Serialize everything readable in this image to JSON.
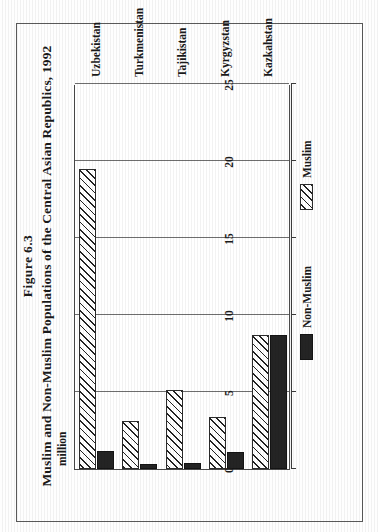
{
  "figure": {
    "number": "Figure 6.3",
    "title": "Muslim and Non-Muslim Populations of the Central Asian Republics, 1992"
  },
  "chart_data": {
    "type": "bar",
    "orientation": "horizontal",
    "title": "Muslim and Non-Muslim Populations of the Central Asian Republics, 1992",
    "xlabel": "million",
    "ylabel": "",
    "unit_label": "million",
    "categories": [
      "Kazkahstan",
      "Kyrgyzstan",
      "Tajikistan",
      "Turkmenistan",
      "Uzbekistan"
    ],
    "series": [
      {
        "name": "Muslim",
        "values": [
          8.7,
          3.4,
          5.1,
          3.1,
          19.5
        ]
      },
      {
        "name": "Non-Muslim",
        "values": [
          8.7,
          1.1,
          0.4,
          0.3,
          1.2
        ]
      }
    ],
    "xlim": [
      0,
      25
    ],
    "xticks": [
      0,
      5,
      10,
      15,
      20,
      25
    ],
    "xtick_labels": [
      "0",
      "5",
      "10",
      "15",
      "20",
      "25"
    ],
    "grid": true,
    "legend_position": "bottom-right"
  },
  "axis": {
    "unit": "million",
    "ticks": [
      "0",
      "5",
      "10",
      "15",
      "20",
      "25"
    ]
  },
  "categories": [
    {
      "label": "Kazkahstan"
    },
    {
      "label": "Kyrgyzstan"
    },
    {
      "label": "Tajikistan"
    },
    {
      "label": "Turkmenistan"
    },
    {
      "label": "Uzbekistan"
    }
  ],
  "legend": {
    "items": [
      {
        "label": "Non-Muslim",
        "swatch": "solid-black-swatch",
        "color": "#242424"
      },
      {
        "label": "Muslim",
        "swatch": "hatched-swatch",
        "color": "#ffffff"
      }
    ]
  }
}
